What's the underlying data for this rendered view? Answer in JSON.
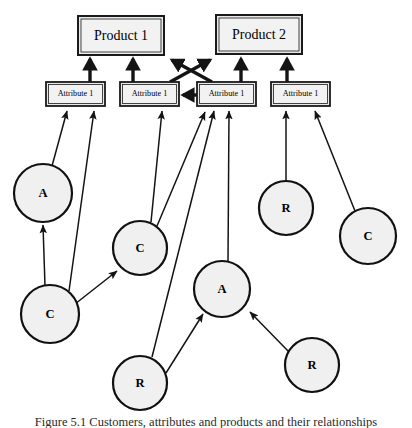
{
  "diagram": {
    "type": "node-link-graph",
    "background_color": "#ffffff",
    "box_fill": "#e9e9e9",
    "circle_fill": "#f0f0f0",
    "stroke_color": "#141414",
    "products": [
      {
        "id": "product1",
        "label": "Product 1",
        "x": 78,
        "y": 16,
        "w": 86,
        "h": 39
      },
      {
        "id": "product2",
        "label": "Product 2",
        "x": 216,
        "y": 15,
        "w": 86,
        "h": 39
      }
    ],
    "attributes": [
      {
        "id": "attr1",
        "label": "Attribute 1",
        "x": 46,
        "y": 82,
        "w": 59,
        "h": 24
      },
      {
        "id": "attr2",
        "label": "Attribute 1",
        "x": 120,
        "y": 82,
        "w": 59,
        "h": 24
      },
      {
        "id": "attr3",
        "label": "Attribute 1",
        "x": 197,
        "y": 82,
        "w": 59,
        "h": 24
      },
      {
        "id": "attr4",
        "label": "Attribute 1",
        "x": 271,
        "y": 82,
        "w": 59,
        "h": 24
      }
    ],
    "circles": [
      {
        "id": "c-a-left",
        "label": "A",
        "cx": 43,
        "cy": 193,
        "r": 29
      },
      {
        "id": "c-c-left",
        "label": "C",
        "cx": 50,
        "cy": 314,
        "r": 29
      },
      {
        "id": "c-c-mid",
        "label": "C",
        "cx": 140,
        "cy": 248,
        "r": 27
      },
      {
        "id": "c-a-mid",
        "label": "A",
        "cx": 222,
        "cy": 289,
        "r": 28
      },
      {
        "id": "c-r-bottom",
        "label": "R",
        "cx": 140,
        "cy": 383,
        "r": 27
      },
      {
        "id": "c-r-right",
        "label": "R",
        "cx": 312,
        "cy": 365,
        "r": 27
      },
      {
        "id": "c-r-upper",
        "label": "R",
        "cx": 286,
        "cy": 208,
        "r": 27
      },
      {
        "id": "c-c-right",
        "label": "C",
        "cx": 368,
        "cy": 236,
        "r": 28
      }
    ],
    "thick_edges": [
      {
        "id": "attr1-to-product1",
        "from": "attr1",
        "to": "product1",
        "x1": 90,
        "y1": 82,
        "x2": 90,
        "y2": 57
      },
      {
        "id": "attr2-to-product1",
        "from": "attr2",
        "to": "product1",
        "x1": 133,
        "y1": 82,
        "x2": 133,
        "y2": 57
      },
      {
        "id": "attr3-to-product2",
        "from": "attr3",
        "to": "product2",
        "x1": 241,
        "y1": 82,
        "x2": 241,
        "y2": 57
      },
      {
        "id": "attr4-to-product2",
        "from": "attr4",
        "to": "product2",
        "x1": 287,
        "y1": 82,
        "x2": 287,
        "y2": 57
      },
      {
        "id": "attr2-to-product2-cross",
        "from": "attr2",
        "to": "product2",
        "x1": 170,
        "y1": 82,
        "x2": 212,
        "y2": 58
      },
      {
        "id": "attr3-to-product1-cross",
        "from": "attr3",
        "to": "product1",
        "x1": 212,
        "y1": 82,
        "x2": 170,
        "y2": 58
      },
      {
        "id": "attr3-to-attr2",
        "from": "attr3",
        "to": "attr2",
        "x1": 197,
        "y1": 95,
        "x2": 181,
        "y2": 95
      }
    ],
    "thin_edges": [
      {
        "id": "cA-left-to-attr1",
        "from": "c-a-left",
        "to": "attr1",
        "x1": 52,
        "y1": 166,
        "x2": 66,
        "y2": 110
      },
      {
        "id": "cC-left-to-cA-left",
        "from": "c-c-left",
        "to": "c-a-left",
        "x1": 45,
        "y1": 286,
        "x2": 43,
        "y2": 224
      },
      {
        "id": "cC-left-to-attr1",
        "from": "c-c-left",
        "to": "attr1",
        "x1": 69,
        "y1": 291,
        "x2": 94,
        "y2": 110
      },
      {
        "id": "cC-left-to-cC-mid",
        "from": "c-c-left",
        "to": "c-c-mid",
        "x1": 74,
        "y1": 303,
        "x2": 115,
        "y2": 270
      },
      {
        "id": "cC-mid-to-attr2",
        "from": "c-c-mid",
        "to": "attr2",
        "x1": 151,
        "y1": 223,
        "x2": 162,
        "y2": 110
      },
      {
        "id": "cC-mid-to-attr3",
        "from": "c-c-mid",
        "to": "attr3",
        "x1": 156,
        "y1": 225,
        "x2": 204,
        "y2": 111
      },
      {
        "id": "cR-bottom-to-attr3",
        "from": "c-r-bottom",
        "to": "attr3",
        "x1": 152,
        "y1": 357,
        "x2": 213,
        "y2": 110
      },
      {
        "id": "cR-bottom-to-cA-mid",
        "from": "c-r-bottom",
        "to": "c-a-mid",
        "x1": 166,
        "y1": 373,
        "x2": 202,
        "y2": 313
      },
      {
        "id": "cA-mid-to-attr3",
        "from": "c-a-mid",
        "to": "attr3",
        "x1": 228,
        "y1": 261,
        "x2": 229,
        "y2": 110
      },
      {
        "id": "cR-right-to-cA-mid",
        "from": "c-r-right",
        "to": "c-a-mid",
        "x1": 289,
        "y1": 352,
        "x2": 249,
        "y2": 311
      },
      {
        "id": "cR-upper-to-attr4",
        "from": "c-r-upper",
        "to": "attr4",
        "x1": 286,
        "y1": 181,
        "x2": 286,
        "y2": 110
      },
      {
        "id": "cC-right-to-attr4",
        "from": "c-c-right",
        "to": "attr4",
        "x1": 355,
        "y1": 211,
        "x2": 314,
        "y2": 110
      }
    ],
    "caption": "Figure 5.1 Customers, attributes and products and their relationships"
  }
}
